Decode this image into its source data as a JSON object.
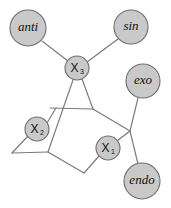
{
  "figure": {
    "kind": "molecular-structure-diagram",
    "background_color": "#ffffff",
    "line_color": "#7a7a7a",
    "node_fill_color": "#c9c9c9",
    "node_stroke_color": "#6f6f6f",
    "label_color": "#111111",
    "width": 171,
    "height": 208
  },
  "nodes": [
    {
      "id": "anti",
      "label": "anti",
      "subscript": "",
      "style": "italic",
      "cx": 28,
      "cy": 28,
      "r": 18,
      "font_size": 13
    },
    {
      "id": "sin",
      "label": "sin",
      "subscript": "",
      "style": "italic",
      "cx": 131,
      "cy": 27,
      "r": 17,
      "font_size": 13
    },
    {
      "id": "x3",
      "label": "X",
      "subscript": "3",
      "style": "upright",
      "cx": 77,
      "cy": 68,
      "r": 12,
      "font_size": 12
    },
    {
      "id": "exo",
      "label": "exo",
      "subscript": "",
      "style": "italic",
      "cx": 143,
      "cy": 81,
      "r": 17,
      "font_size": 13
    },
    {
      "id": "x2",
      "label": "X",
      "subscript": "2",
      "style": "upright",
      "cx": 37,
      "cy": 129,
      "r": 12,
      "font_size": 12
    },
    {
      "id": "x1",
      "label": "X",
      "subscript": "1",
      "style": "upright",
      "cx": 108,
      "cy": 148,
      "r": 12,
      "font_size": 12
    },
    {
      "id": "endo",
      "label": "endo",
      "subscript": "",
      "style": "italic",
      "cx": 142,
      "cy": 181,
      "r": 18,
      "font_size": 13
    }
  ],
  "edges": [
    {
      "id": "anti-x3",
      "from": "anti",
      "to": "x3",
      "x1": 42,
      "y1": 41,
      "x2": 68,
      "y2": 61
    },
    {
      "id": "sin-x3",
      "from": "sin",
      "to": "x3",
      "x1": 118,
      "y1": 39,
      "x2": 87,
      "y2": 62
    },
    {
      "id": "x3-ringA",
      "from": "x3",
      "to": "v-left-mid",
      "x1": 73,
      "y1": 80,
      "x2": 48,
      "y2": 152
    },
    {
      "id": "x3-ringB",
      "from": "x3",
      "to": "v-top-right",
      "x1": 82,
      "y1": 79,
      "x2": 93,
      "y2": 109
    },
    {
      "id": "cross-bar",
      "from": "v-left-upper",
      "to": "v-top-right",
      "x1": 50,
      "y1": 108,
      "x2": 93,
      "y2": 109
    },
    {
      "id": "x2-bar",
      "from": "x2",
      "to": "v-left-upper",
      "x1": 47,
      "y1": 123,
      "x2": 56,
      "y2": 108
    },
    {
      "id": "x2-downleft",
      "from": "x2",
      "to": "v-bot-left",
      "x1": 28,
      "y1": 136,
      "x2": 12,
      "y2": 153
    },
    {
      "id": "bot-left-h",
      "from": "v-bot-left",
      "to": "v-left-mid",
      "x1": 12,
      "y1": 153,
      "x2": 48,
      "y2": 152
    },
    {
      "id": "ring-lower",
      "from": "v-left-mid",
      "to": "v-bottom",
      "x1": 48,
      "y1": 152,
      "x2": 84,
      "y2": 173
    },
    {
      "id": "bottom-x1",
      "from": "v-bottom",
      "to": "x1",
      "x1": 84,
      "y1": 173,
      "x2": 99,
      "y2": 156
    },
    {
      "id": "x1-junction",
      "from": "x1",
      "to": "v-junction",
      "x1": 117,
      "y1": 141,
      "x2": 130,
      "y2": 131
    },
    {
      "id": "topright-junction",
      "from": "v-top-right",
      "to": "v-junction",
      "x1": 93,
      "y1": 109,
      "x2": 130,
      "y2": 131
    },
    {
      "id": "exo-junction",
      "from": "exo",
      "to": "v-junction",
      "x1": 138,
      "y1": 98,
      "x2": 130,
      "y2": 131
    },
    {
      "id": "junction-endo",
      "from": "v-junction",
      "to": "endo",
      "x1": 130,
      "y1": 131,
      "x2": 138,
      "y2": 164
    }
  ]
}
